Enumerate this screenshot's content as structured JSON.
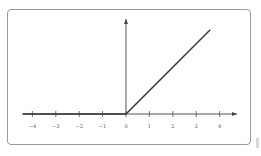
{
  "chart_data": {
    "type": "line",
    "title": "",
    "xlabel": "",
    "ylabel": "",
    "function": "ReLU: y = max(0, x)",
    "xlim": [
      -4.4,
      4.7
    ],
    "ylim": [
      0,
      4
    ],
    "grid": false,
    "x_ticks": [
      -4,
      -3,
      -2,
      -1,
      0,
      1,
      2,
      3,
      4
    ],
    "x_tick_labels": [
      "−4",
      "−3",
      "−2",
      "−1",
      "0",
      "1",
      "2",
      "3",
      "4"
    ],
    "series": [
      {
        "name": "relu",
        "x": [
          -4.4,
          0,
          3.6
        ],
        "y": [
          0,
          0,
          3.6
        ],
        "color": "#333333"
      }
    ]
  }
}
